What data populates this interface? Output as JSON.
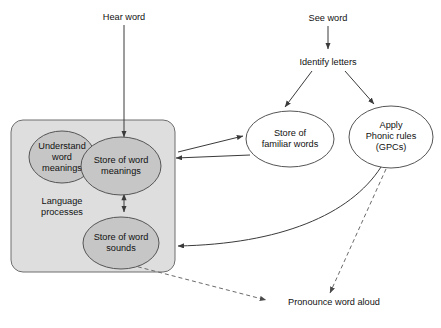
{
  "figure": {
    "type": "flow-diagram",
    "title": "",
    "background_color": "#ffffff"
  },
  "colors": {
    "box_fill": "#dedede",
    "box_stroke": "#6e6e6e",
    "ellipse_shaded_fill": "#c6c6c6",
    "ellipse_shaded_stroke": "#555555",
    "ellipse_plain_fill": "#ffffff",
    "ellipse_plain_stroke": "#555555",
    "arrow_solid": "#3a3a3a",
    "arrow_dashed": "#6a6a6a",
    "text": "#111111"
  },
  "labels": {
    "hear_word": "Hear word",
    "see_word": "See word",
    "identify_letters": "Identify letters",
    "pronounce_word_aloud": "Pronounce word aloud",
    "language_processes_line1": "Language",
    "language_processes_line2": "processes"
  },
  "nodes": [
    {
      "id": "understand-word-meanings",
      "shape": "ellipse",
      "style": "shaded",
      "lines": [
        "Understand",
        "word",
        "meanings"
      ],
      "cx": 62,
      "cy": 157,
      "rx": 33,
      "ry": 26
    },
    {
      "id": "store-of-word-meanings",
      "shape": "ellipse",
      "style": "shaded",
      "lines": [
        "Store of word",
        "meanings"
      ],
      "cx": 121,
      "cy": 166,
      "rx": 40,
      "ry": 29
    },
    {
      "id": "store-of-word-sounds",
      "shape": "ellipse",
      "style": "shaded",
      "lines": [
        "Store of word",
        "sounds"
      ],
      "cx": 121,
      "cy": 243,
      "rx": 38,
      "ry": 26
    },
    {
      "id": "store-of-familiar-words",
      "shape": "ellipse",
      "style": "plain",
      "lines": [
        "Store of",
        "familiar words"
      ],
      "cx": 290,
      "cy": 139,
      "rx": 44,
      "ry": 28
    },
    {
      "id": "apply-phonic-rules",
      "shape": "ellipse",
      "style": "plain",
      "lines": [
        "Apply",
        "Phonic rules",
        "(GPCs)"
      ],
      "cx": 391,
      "cy": 137,
      "rx": 42,
      "ry": 31
    }
  ],
  "group_box": {
    "id": "language-processes-box",
    "x": 11,
    "y": 120,
    "width": 164,
    "height": 152,
    "radius": 12
  },
  "edges": [
    {
      "id": "hear-word-to-store-of-word-meanings",
      "style": "solid",
      "arrow": "single"
    },
    {
      "id": "see-word-to-identify-letters",
      "style": "solid",
      "arrow": "single"
    },
    {
      "id": "identify-letters-to-store-of-familiar-words",
      "style": "solid",
      "arrow": "single"
    },
    {
      "id": "identify-letters-to-apply-phonic-rules",
      "style": "solid",
      "arrow": "single"
    },
    {
      "id": "store-of-word-meanings-to-store-of-familiar-words",
      "style": "solid",
      "arrow": "single"
    },
    {
      "id": "store-of-familiar-words-to-store-of-word-meanings",
      "style": "solid",
      "arrow": "single"
    },
    {
      "id": "apply-phonic-rules-to-store-of-word-sounds",
      "style": "solid",
      "arrow": "single",
      "curved": true
    },
    {
      "id": "store-of-word-meanings-to-store-of-word-sounds",
      "style": "solid",
      "arrow": "double"
    },
    {
      "id": "store-of-word-sounds-to-pronounce-word-aloud",
      "style": "dashed",
      "arrow": "single"
    },
    {
      "id": "apply-phonic-rules-to-pronounce-word-aloud",
      "style": "dashed",
      "arrow": "single"
    }
  ]
}
